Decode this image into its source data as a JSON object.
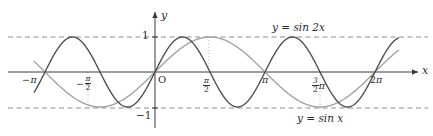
{
  "figure": {
    "background_color": "#ffffff"
  },
  "axes": {
    "x_axis_label": "x",
    "y_axis_label": "y",
    "origin_label": "O",
    "x_ticks": [
      {
        "value": -3.14159265,
        "label_parts": {
          "sign": "−",
          "pi": "π"
        },
        "type": "pi",
        "px": 33
      },
      {
        "value": -1.57079633,
        "label_parts": {
          "sign": "−",
          "num": "π",
          "den": "2"
        },
        "type": "frac",
        "px": 88
      },
      {
        "value": 1.57079633,
        "label_parts": {
          "sign": "",
          "num": "π",
          "den": "2"
        },
        "type": "frac",
        "px": 209
      },
      {
        "value": 3.14159265,
        "label_parts": {
          "sign": "",
          "pi": "π"
        },
        "type": "pi",
        "px": 265
      },
      {
        "value": 4.71238898,
        "label_parts": {
          "sign": "",
          "num": "3",
          "den": "2",
          "pi": "π"
        },
        "type": "frac-pi",
        "px": 320
      },
      {
        "value": 6.28318531,
        "label_parts": {
          "sign": "",
          "coef": "2",
          "pi": "π"
        },
        "type": "coef-pi",
        "px": 375
      }
    ],
    "y_ticks": [
      {
        "value": 1,
        "label": "1"
      },
      {
        "value": -1,
        "label": "−1"
      }
    ],
    "xlim": [
      -3.6,
      7.05
    ],
    "ylim": [
      -1.45,
      1.45
    ],
    "grid": "dashed horizontal lines at y = 1 and y = -1; dotted vertical lines at x = -pi/2, pi/2, 3pi/2"
  },
  "chart_data": {
    "type": "line",
    "title": "",
    "xlabel": "x",
    "ylabel": "y",
    "xlim": [
      -3.6,
      7.05
    ],
    "ylim": [
      -1.45,
      1.45
    ],
    "grid": true,
    "legend": "inline annotations on curves",
    "x_tick_labels": [
      "−π",
      "−π/2",
      "π/2",
      "π",
      "3π/2",
      "2π"
    ],
    "x_tick_values": [
      -3.14159265,
      -1.57079633,
      1.57079633,
      3.14159265,
      4.71238898,
      6.28318531
    ],
    "y_tick_labels": [
      "1",
      "−1"
    ],
    "y_tick_values": [
      1,
      -1
    ],
    "series": [
      {
        "name": "y = sin 2x",
        "label": "y = sin 2x",
        "color": "#4c4c4c",
        "expression": "sin(2x)",
        "amplitude": 1,
        "period": 3.14159265,
        "key_points": [
          {
            "x": -3.14159265,
            "y": 0
          },
          {
            "x": -2.35619449,
            "y": 1
          },
          {
            "x": -1.57079633,
            "y": 0
          },
          {
            "x": -0.78539816,
            "y": -1
          },
          {
            "x": 0,
            "y": 0
          },
          {
            "x": 0.78539816,
            "y": 1
          },
          {
            "x": 1.57079633,
            "y": 0
          },
          {
            "x": 2.35619449,
            "y": -1
          },
          {
            "x": 3.14159265,
            "y": 0
          },
          {
            "x": 3.92699082,
            "y": 1
          },
          {
            "x": 4.71238898,
            "y": 0
          },
          {
            "x": 5.49778714,
            "y": -1
          },
          {
            "x": 6.28318531,
            "y": 0
          }
        ]
      },
      {
        "name": "y = sin x",
        "label": "y = sin x",
        "color": "#a0a0a0",
        "expression": "sin(x)",
        "amplitude": 1,
        "period": 6.28318531,
        "key_points": [
          {
            "x": -3.14159265,
            "y": 0
          },
          {
            "x": -1.57079633,
            "y": -1
          },
          {
            "x": 0,
            "y": 0
          },
          {
            "x": 1.57079633,
            "y": 1
          },
          {
            "x": 3.14159265,
            "y": 0
          },
          {
            "x": 4.71238898,
            "y": -1
          },
          {
            "x": 6.28318531,
            "y": 0
          }
        ]
      }
    ]
  },
  "annotations": {
    "sin2x_label": "y = sin 2x",
    "sinx_label": "y = sin x",
    "sin2x_label_px": {
      "x": 272,
      "y": 22
    },
    "sinx_label_px": {
      "x": 297,
      "y": 113
    }
  },
  "colors": {
    "sin2x": "#4c4c4c",
    "sinx": "#a0a0a0",
    "axis": "#3a3a3a",
    "grid_dash": "#8d8d8d",
    "grid_dot": "#a8a8a8",
    "text": "#2b2b2b"
  }
}
